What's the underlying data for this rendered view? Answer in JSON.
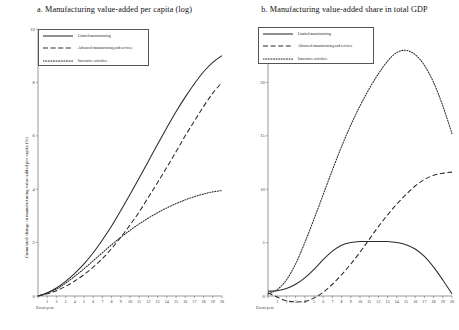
{
  "chart_data": [
    {
      "type": "line",
      "panel": "a",
      "title": "a. Manufacturing value-added per capita (log)",
      "xlabel": "Event year",
      "ylabel": "Cumulated change in manufacturing value-added per capita (%)",
      "xlim": [
        0,
        20
      ],
      "ylim": [
        0,
        10
      ],
      "xticks": [
        "Event year",
        "1",
        "2",
        "3",
        "4",
        "5",
        "6",
        "7",
        "8",
        "9",
        "10",
        "11",
        "12",
        "13",
        "14",
        "15",
        "16",
        "17",
        "18",
        "19",
        "20"
      ],
      "yticks": [
        0,
        2,
        4,
        6,
        8,
        10
      ],
      "grid": false,
      "legend_position": "top-left",
      "x": [
        0,
        1,
        2,
        3,
        4,
        5,
        6,
        7,
        8,
        9,
        10,
        11,
        12,
        13,
        14,
        15,
        16,
        17,
        18,
        19,
        20
      ],
      "series": [
        {
          "name": "Limited manufacturing",
          "style": "solid",
          "values": [
            0.0,
            0.12,
            0.3,
            0.55,
            0.85,
            1.2,
            1.62,
            2.1,
            2.62,
            3.2,
            3.8,
            4.42,
            5.05,
            5.68,
            6.3,
            6.9,
            7.45,
            7.95,
            8.4,
            8.75,
            9.0
          ]
        },
        {
          "name": "Advanced manufacturing and services",
          "style": "dashed",
          "values": [
            0.0,
            0.08,
            0.2,
            0.36,
            0.56,
            0.8,
            1.08,
            1.4,
            1.78,
            2.2,
            2.66,
            3.15,
            3.7,
            4.25,
            4.82,
            5.4,
            6.0,
            6.55,
            7.1,
            7.6,
            8.0
          ]
        },
        {
          "name": "Innovative activities",
          "style": "dotted",
          "values": [
            0.0,
            0.1,
            0.26,
            0.48,
            0.74,
            1.02,
            1.32,
            1.62,
            1.92,
            2.2,
            2.46,
            2.7,
            2.92,
            3.12,
            3.3,
            3.46,
            3.6,
            3.72,
            3.82,
            3.9,
            3.95
          ]
        }
      ]
    },
    {
      "type": "line",
      "panel": "b",
      "title": "b. Manufacturing value-added share in total GDP",
      "xlabel": "Event year",
      "ylabel": "Cumulated change in the share of MVA (%)",
      "xlim": [
        0,
        20
      ],
      "ylim": [
        0,
        25
      ],
      "xticks": [
        "Event year",
        "1",
        "2",
        "3",
        "4",
        "5",
        "6",
        "7",
        "8",
        "9",
        "10",
        "11",
        "12",
        "13",
        "14",
        "15",
        "16",
        "17",
        "18",
        "19",
        "20"
      ],
      "yticks": [
        0,
        5,
        10,
        15,
        20,
        25
      ],
      "grid": false,
      "legend_position": "top-left",
      "x": [
        0,
        1,
        2,
        3,
        4,
        5,
        6,
        7,
        8,
        9,
        10,
        11,
        12,
        13,
        14,
        15,
        16,
        17,
        18,
        19,
        20
      ],
      "series": [
        {
          "name": "Limited manufacturing",
          "style": "solid",
          "values": [
            0.45,
            0.5,
            0.7,
            1.1,
            1.7,
            2.5,
            3.4,
            4.2,
            4.75,
            5.0,
            5.1,
            5.1,
            5.1,
            5.1,
            5.0,
            4.8,
            4.4,
            3.7,
            2.7,
            1.5,
            0.2
          ]
        },
        {
          "name": "Advanced manufacturing and services",
          "style": "dashed",
          "values": [
            0.3,
            -0.1,
            -0.45,
            -0.55,
            -0.5,
            -0.2,
            0.35,
            1.1,
            2.0,
            3.0,
            4.1,
            5.3,
            6.5,
            7.6,
            8.6,
            9.5,
            10.3,
            10.9,
            11.3,
            11.5,
            11.6
          ]
        },
        {
          "name": "Innovative activities",
          "style": "dotted",
          "values": [
            0.2,
            0.6,
            1.5,
            3.0,
            5.0,
            7.2,
            9.5,
            11.8,
            14.0,
            16.0,
            17.8,
            19.4,
            20.8,
            22.0,
            22.8,
            23.0,
            22.6,
            21.6,
            20.0,
            17.8,
            15.2
          ]
        }
      ]
    }
  ]
}
